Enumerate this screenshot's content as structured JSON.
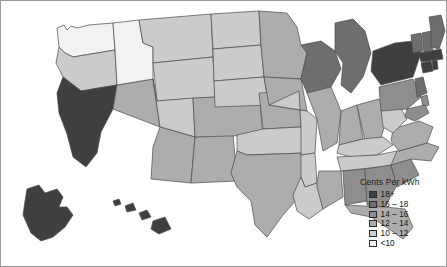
{
  "figure": {
    "title": "",
    "frame_border_color": "#9a9a9a",
    "background": "#ffffff"
  },
  "legend": {
    "title": "Cents Per kWh",
    "position": "bottom-right",
    "entries": [
      {
        "label": "18+",
        "color": "#3f3f3f",
        "min": 18,
        "max": null
      },
      {
        "label": "16 – 18",
        "color": "#6e6e6e",
        "min": 16,
        "max": 18
      },
      {
        "label": "14 – 16",
        "color": "#8e8e8e",
        "min": 14,
        "max": 16
      },
      {
        "label": "12 – 14",
        "color": "#adadad",
        "min": 12,
        "max": 14
      },
      {
        "label": "10 – 12",
        "color": "#cbcbcb",
        "min": 10,
        "max": 12
      },
      {
        "label": "<10",
        "color": "#f2f2f2",
        "min": null,
        "max": 10
      }
    ]
  },
  "chart_data": {
    "type": "choropleth",
    "title": "Cents Per kWh",
    "region": "United States",
    "unit": "cents per kWh",
    "bins": [
      "<10",
      "10 – 12",
      "12 – 14",
      "14 – 16",
      "16 – 18",
      "18+"
    ],
    "bin_colors": [
      "#f2f2f2",
      "#cbcbcb",
      "#adadad",
      "#8e8e8e",
      "#6e6e6e",
      "#3f3f3f"
    ],
    "states": [
      {
        "code": "WA",
        "name": "Washington",
        "bin": "<10"
      },
      {
        "code": "OR",
        "name": "Oregon",
        "bin": "10 – 12"
      },
      {
        "code": "CA",
        "name": "California",
        "bin": "18+"
      },
      {
        "code": "NV",
        "name": "Nevada",
        "bin": "12 – 14"
      },
      {
        "code": "ID",
        "name": "Idaho",
        "bin": "<10"
      },
      {
        "code": "MT",
        "name": "Montana",
        "bin": "10 – 12"
      },
      {
        "code": "WY",
        "name": "Wyoming",
        "bin": "10 – 12"
      },
      {
        "code": "UT",
        "name": "Utah",
        "bin": "10 – 12"
      },
      {
        "code": "AZ",
        "name": "Arizona",
        "bin": "12 – 14"
      },
      {
        "code": "NM",
        "name": "New Mexico",
        "bin": "12 – 14"
      },
      {
        "code": "CO",
        "name": "Colorado",
        "bin": "12 – 14"
      },
      {
        "code": "ND",
        "name": "North Dakota",
        "bin": "10 – 12"
      },
      {
        "code": "SD",
        "name": "South Dakota",
        "bin": "10 – 12"
      },
      {
        "code": "NE",
        "name": "Nebraska",
        "bin": "10 – 12"
      },
      {
        "code": "KS",
        "name": "Kansas",
        "bin": "12 – 14"
      },
      {
        "code": "OK",
        "name": "Oklahoma",
        "bin": "10 – 12"
      },
      {
        "code": "TX",
        "name": "Texas",
        "bin": "12 – 14"
      },
      {
        "code": "MN",
        "name": "Minnesota",
        "bin": "12 – 14"
      },
      {
        "code": "IA",
        "name": "Iowa",
        "bin": "12 – 14"
      },
      {
        "code": "MO",
        "name": "Missouri",
        "bin": "10 – 12"
      },
      {
        "code": "AR",
        "name": "Arkansas",
        "bin": "10 – 12"
      },
      {
        "code": "LA",
        "name": "Louisiana",
        "bin": "10 – 12"
      },
      {
        "code": "WI",
        "name": "Wisconsin",
        "bin": "16 – 18"
      },
      {
        "code": "IL",
        "name": "Illinois",
        "bin": "12 – 14"
      },
      {
        "code": "MI",
        "name": "Michigan",
        "bin": "16 – 18"
      },
      {
        "code": "IN",
        "name": "Indiana",
        "bin": "12 – 14"
      },
      {
        "code": "OH",
        "name": "Ohio",
        "bin": "12 – 14"
      },
      {
        "code": "KY",
        "name": "Kentucky",
        "bin": "10 – 12"
      },
      {
        "code": "TN",
        "name": "Tennessee",
        "bin": "10 – 12"
      },
      {
        "code": "MS",
        "name": "Mississippi",
        "bin": "12 – 14"
      },
      {
        "code": "AL",
        "name": "Alabama",
        "bin": "14 – 16"
      },
      {
        "code": "GA",
        "name": "Georgia",
        "bin": "14 – 16"
      },
      {
        "code": "FL",
        "name": "Florida",
        "bin": "12 – 14"
      },
      {
        "code": "SC",
        "name": "South Carolina",
        "bin": "14 – 16"
      },
      {
        "code": "NC",
        "name": "North Carolina",
        "bin": "12 – 14"
      },
      {
        "code": "VA",
        "name": "Virginia",
        "bin": "12 – 14"
      },
      {
        "code": "WV",
        "name": "West Virginia",
        "bin": "10 – 12"
      },
      {
        "code": "PA",
        "name": "Pennsylvania",
        "bin": "14 – 16"
      },
      {
        "code": "NY",
        "name": "New York",
        "bin": "18+"
      },
      {
        "code": "NJ",
        "name": "New Jersey",
        "bin": "16 – 18"
      },
      {
        "code": "DE",
        "name": "Delaware",
        "bin": "14 – 16"
      },
      {
        "code": "MD",
        "name": "Maryland",
        "bin": "14 – 16"
      },
      {
        "code": "DC",
        "name": "District of Columbia",
        "bin": "14 – 16"
      },
      {
        "code": "CT",
        "name": "Connecticut",
        "bin": "18+"
      },
      {
        "code": "RI",
        "name": "Rhode Island",
        "bin": "18+"
      },
      {
        "code": "MA",
        "name": "Massachusetts",
        "bin": "18+"
      },
      {
        "code": "VT",
        "name": "Vermont",
        "bin": "16 – 18"
      },
      {
        "code": "NH",
        "name": "New Hampshire",
        "bin": "16 – 18"
      },
      {
        "code": "ME",
        "name": "Maine",
        "bin": "16 – 18"
      },
      {
        "code": "AK",
        "name": "Alaska",
        "bin": "18+"
      },
      {
        "code": "HI",
        "name": "Hawaii",
        "bin": "18+"
      }
    ]
  }
}
